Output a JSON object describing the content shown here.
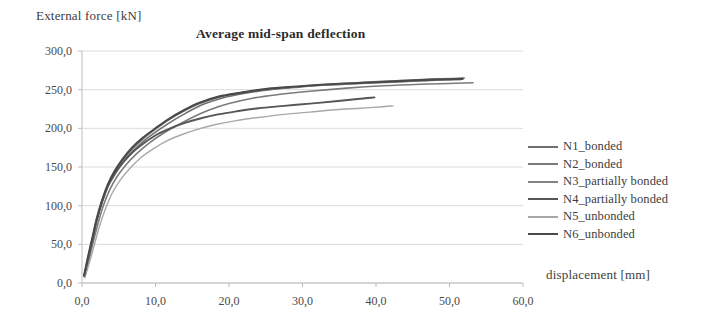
{
  "chart_data": {
    "type": "line",
    "title": "Average mid-span deflection",
    "xlabel": "displacement [mm]",
    "ylabel": "External force [kN]",
    "xlim": [
      0,
      60
    ],
    "ylim": [
      0,
      300
    ],
    "grid": true,
    "legend_position": "right",
    "x_ticks": [
      "0,0",
      "10,0",
      "20,0",
      "30,0",
      "40,0",
      "50,0",
      "60,0"
    ],
    "y_ticks": [
      "0,0",
      "50,0",
      "100,0",
      "150,0",
      "200,0",
      "250,0",
      "300,0"
    ],
    "x_tick_values": [
      0,
      10,
      20,
      30,
      40,
      50,
      60
    ],
    "y_tick_values": [
      0,
      50,
      100,
      150,
      200,
      250,
      300
    ],
    "series": [
      {
        "name": "N1_bonded",
        "color": "#6f6f6f",
        "width": 1.6,
        "points": [
          [
            0.3,
            9
          ],
          [
            0.8,
            30
          ],
          [
            1.4,
            55
          ],
          [
            2.0,
            80
          ],
          [
            2.7,
            103
          ],
          [
            3.5,
            124
          ],
          [
            4.5,
            141
          ],
          [
            5.6,
            156
          ],
          [
            7.0,
            171
          ],
          [
            8.6,
            185
          ],
          [
            10.3,
            197
          ],
          [
            12.2,
            209
          ],
          [
            14.2,
            220
          ],
          [
            16.5,
            231
          ],
          [
            19.0,
            239
          ],
          [
            22.0,
            245
          ],
          [
            25.5,
            250
          ],
          [
            29.5,
            254
          ],
          [
            34.0,
            257
          ],
          [
            39.0,
            260
          ],
          [
            44.0,
            262
          ],
          [
            48.5,
            264
          ],
          [
            52.0,
            265
          ]
        ]
      },
      {
        "name": "N2_bonded",
        "color": "#7b7b7b",
        "width": 1.6,
        "points": [
          [
            0.35,
            8
          ],
          [
            0.9,
            28
          ],
          [
            1.5,
            52
          ],
          [
            2.2,
            78
          ],
          [
            2.9,
            100
          ],
          [
            3.8,
            121
          ],
          [
            4.8,
            138
          ],
          [
            6.0,
            153
          ],
          [
            7.4,
            167
          ],
          [
            9.0,
            180
          ],
          [
            10.8,
            192
          ],
          [
            12.8,
            203
          ],
          [
            15.0,
            214
          ],
          [
            17.4,
            224
          ],
          [
            20.0,
            232
          ],
          [
            23.2,
            239
          ],
          [
            27.0,
            244
          ],
          [
            31.0,
            248
          ],
          [
            36.0,
            252
          ],
          [
            41.0,
            255
          ],
          [
            46.0,
            257
          ],
          [
            50.0,
            258
          ],
          [
            53.2,
            259
          ]
        ]
      },
      {
        "name": "N3_partially bonded",
        "color": "#838383",
        "width": 1.6,
        "points": [
          [
            0.3,
            10
          ],
          [
            0.85,
            32
          ],
          [
            1.4,
            57
          ],
          [
            2.0,
            82
          ],
          [
            2.7,
            105
          ],
          [
            3.5,
            126
          ],
          [
            4.4,
            143
          ],
          [
            5.5,
            158
          ],
          [
            6.9,
            173
          ],
          [
            8.4,
            187
          ],
          [
            10.0,
            199
          ],
          [
            11.8,
            211
          ],
          [
            13.8,
            222
          ],
          [
            16.0,
            232
          ],
          [
            18.5,
            240
          ],
          [
            21.5,
            246
          ],
          [
            25.0,
            250
          ],
          [
            29.0,
            253
          ],
          [
            33.5,
            256
          ],
          [
            38.0,
            258
          ],
          [
            43.0,
            260
          ],
          [
            47.5,
            262
          ],
          [
            51.5,
            263
          ]
        ]
      },
      {
        "name": "N4_partially bonded",
        "color": "#565656",
        "width": 1.9,
        "points": [
          [
            0.3,
            9
          ],
          [
            0.8,
            31
          ],
          [
            1.4,
            56
          ],
          [
            2.0,
            81
          ],
          [
            2.7,
            104
          ],
          [
            3.5,
            125
          ],
          [
            4.5,
            142
          ],
          [
            5.6,
            156
          ],
          [
            7.0,
            170
          ],
          [
            8.6,
            182
          ],
          [
            10.2,
            192
          ],
          [
            12.0,
            200
          ],
          [
            14.0,
            207
          ],
          [
            16.2,
            213
          ],
          [
            18.5,
            218
          ],
          [
            21.0,
            222
          ],
          [
            24.0,
            226
          ],
          [
            27.5,
            229
          ],
          [
            31.0,
            232
          ],
          [
            34.5,
            235
          ],
          [
            37.5,
            238
          ],
          [
            39.8,
            240
          ]
        ]
      },
      {
        "name": "N5_unbonded",
        "color": "#a8a8a8",
        "width": 1.4,
        "points": [
          [
            0.4,
            7
          ],
          [
            1.0,
            26
          ],
          [
            1.7,
            50
          ],
          [
            2.4,
            74
          ],
          [
            3.2,
            96
          ],
          [
            4.1,
            116
          ],
          [
            5.2,
            133
          ],
          [
            6.5,
            148
          ],
          [
            8.0,
            162
          ],
          [
            9.8,
            174
          ],
          [
            11.6,
            184
          ],
          [
            13.6,
            192
          ],
          [
            15.8,
            199
          ],
          [
            18.2,
            205
          ],
          [
            21.0,
            210
          ],
          [
            24.0,
            214
          ],
          [
            27.5,
            218
          ],
          [
            31.0,
            221
          ],
          [
            34.5,
            224
          ],
          [
            38.0,
            226
          ],
          [
            41.0,
            228
          ],
          [
            42.3,
            229
          ]
        ]
      },
      {
        "name": "N6_unbonded",
        "color": "#4a4a4a",
        "width": 2.1,
        "points": [
          [
            0.3,
            10
          ],
          [
            0.8,
            33
          ],
          [
            1.4,
            58
          ],
          [
            2.0,
            83
          ],
          [
            2.7,
            106
          ],
          [
            3.5,
            127
          ],
          [
            4.4,
            144
          ],
          [
            5.5,
            160
          ],
          [
            6.8,
            175
          ],
          [
            8.3,
            188
          ],
          [
            10.0,
            200
          ],
          [
            11.8,
            212
          ],
          [
            13.8,
            223
          ],
          [
            16.0,
            233
          ],
          [
            18.6,
            241
          ],
          [
            21.6,
            246
          ],
          [
            25.2,
            251
          ],
          [
            29.2,
            254
          ],
          [
            33.8,
            257
          ],
          [
            38.5,
            259
          ],
          [
            43.2,
            261
          ],
          [
            47.8,
            263
          ],
          [
            51.8,
            264
          ]
        ]
      }
    ]
  },
  "legend": {
    "items": [
      {
        "label": "N1_bonded",
        "color": "#6f6f6f",
        "width": 1.8
      },
      {
        "label": "N2_bonded",
        "color": "#7b7b7b",
        "width": 1.8
      },
      {
        "label": "N3_partially bonded",
        "color": "#838383",
        "width": 1.8
      },
      {
        "label": "N4_partially bonded",
        "color": "#565656",
        "width": 2.0
      },
      {
        "label": "N5_unbonded",
        "color": "#a8a8a8",
        "width": 1.5
      },
      {
        "label": "N6_unbonded",
        "color": "#4a4a4a",
        "width": 2.4
      }
    ]
  },
  "style": {
    "grid_color": "#dcdcdc",
    "axis_color": "#bdbdbd",
    "text_color": "#3d3d3d",
    "background": "#ffffff"
  }
}
